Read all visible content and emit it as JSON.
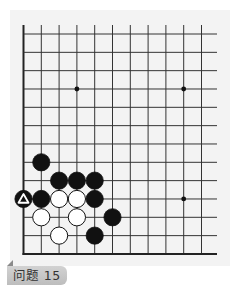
{
  "puzzle": {
    "label": "问题 15",
    "title_prefix": "问题",
    "number": 15
  },
  "board": {
    "columns_visible": 11,
    "rows_visible": 13,
    "edges": [
      "left",
      "bottom"
    ],
    "origin_x": 23.5,
    "origin_y": 34,
    "spacing_x": 17.8,
    "spacing_y": 18.33,
    "line_extent_right": 217,
    "line_extent_top": 25,
    "colors": {
      "background": "#f3f3f3",
      "line": "#333333",
      "edge": "#222222",
      "black_stone": "#111111",
      "white_stone": "#ffffff",
      "label_bg": "#c8c8c8",
      "label_text": "#333333"
    },
    "star_points": [
      {
        "col": 3,
        "row": 3
      },
      {
        "col": 9,
        "row": 3
      },
      {
        "col": 9,
        "row": 9
      }
    ],
    "stones": [
      {
        "color": "black",
        "col": 1,
        "row": 7
      },
      {
        "color": "black",
        "col": 2,
        "row": 8
      },
      {
        "color": "black",
        "col": 3,
        "row": 8
      },
      {
        "color": "black",
        "col": 4,
        "row": 8
      },
      {
        "color": "black",
        "col": 0,
        "row": 9,
        "marker": "triangle"
      },
      {
        "color": "black",
        "col": 1,
        "row": 9
      },
      {
        "color": "white",
        "col": 2,
        "row": 9
      },
      {
        "color": "white",
        "col": 3,
        "row": 9
      },
      {
        "color": "black",
        "col": 4,
        "row": 9
      },
      {
        "color": "white",
        "col": 1,
        "row": 10
      },
      {
        "color": "white",
        "col": 3,
        "row": 10
      },
      {
        "color": "black",
        "col": 5,
        "row": 10
      },
      {
        "color": "white",
        "col": 2,
        "row": 11
      },
      {
        "color": "black",
        "col": 4,
        "row": 11
      }
    ]
  }
}
